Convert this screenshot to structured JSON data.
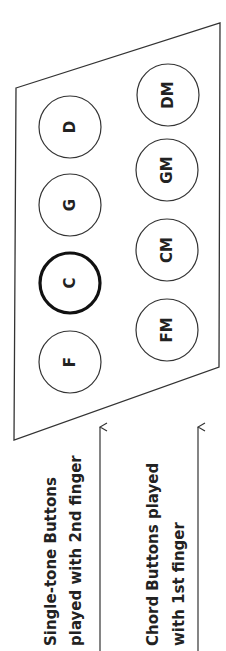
{
  "diagram": {
    "panel": {
      "outline_color": "#333333",
      "vertices": [
        [
          16,
          88
        ],
        [
          220,
          23
        ],
        [
          219,
          367
        ],
        [
          14,
          440
        ]
      ]
    },
    "single_tone_buttons": [
      {
        "label": "D",
        "cx": 70,
        "cy": 127,
        "highlighted": false
      },
      {
        "label": "G",
        "cx": 70,
        "cy": 205,
        "highlighted": false
      },
      {
        "label": "C",
        "cx": 70,
        "cy": 283,
        "highlighted": true
      },
      {
        "label": "F",
        "cx": 70,
        "cy": 362,
        "highlighted": false
      }
    ],
    "chord_buttons": [
      {
        "label": "DM",
        "cx": 168,
        "cy": 95
      },
      {
        "label": "GM",
        "cx": 167,
        "cy": 170
      },
      {
        "label": "CM",
        "cx": 167,
        "cy": 250
      },
      {
        "label": "FM",
        "cx": 167,
        "cy": 330
      }
    ],
    "captions": {
      "single_line1": "Single-tone Buttons",
      "single_line2": "played with 2nd finger",
      "chord_line1": "Chord Buttons played",
      "chord_line2": "with 1st finger"
    },
    "arrows": [
      {
        "name": "single-tone-arrow",
        "x": 100,
        "y_start": 651,
        "y_end": 427
      },
      {
        "name": "chord-arrow",
        "x": 198,
        "y_start": 651,
        "y_end": 427
      }
    ]
  }
}
